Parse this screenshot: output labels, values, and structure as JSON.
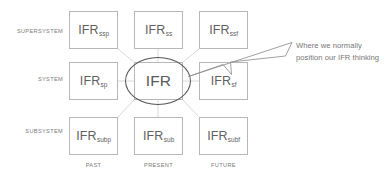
{
  "diagram": {
    "row_labels": [
      "SUPERSYSTEM",
      "SYSTEM",
      "SUBSYSTEM"
    ],
    "col_labels": [
      "PAST",
      "PRESENT",
      "FUTURE"
    ],
    "cells": [
      {
        "base": "IFR",
        "sub": "ssp",
        "row": 0,
        "col": 0,
        "name": "cell-supersystem-past"
      },
      {
        "base": "IFR",
        "sub": "ss",
        "row": 0,
        "col": 1,
        "name": "cell-supersystem-present"
      },
      {
        "base": "IFR",
        "sub": "ssf",
        "row": 0,
        "col": 2,
        "name": "cell-supersystem-future"
      },
      {
        "base": "IFR",
        "sub": "sp",
        "row": 1,
        "col": 0,
        "name": "cell-system-past"
      },
      {
        "base": "IFR",
        "sub": "",
        "row": 1,
        "col": 1,
        "name": "cell-system-present"
      },
      {
        "base": "IFR",
        "sub": "sf",
        "row": 1,
        "col": 2,
        "name": "cell-system-future"
      },
      {
        "base": "IFR",
        "sub": "subp",
        "row": 2,
        "col": 0,
        "name": "cell-subsystem-past"
      },
      {
        "base": "IFR",
        "sub": "sub",
        "row": 2,
        "col": 1,
        "name": "cell-subsystem-present"
      },
      {
        "base": "IFR",
        "sub": "subf",
        "row": 2,
        "col": 2,
        "name": "cell-subsystem-future"
      }
    ],
    "annotation": {
      "text": "Where we normally position our IFR thinking"
    },
    "colors": {
      "box_border": "#b7b7b7",
      "text": "#6b6b6b",
      "circle": "#555555",
      "connector": "#cccccc",
      "arrow": "#8a8a8a",
      "background": "#ffffff"
    }
  }
}
